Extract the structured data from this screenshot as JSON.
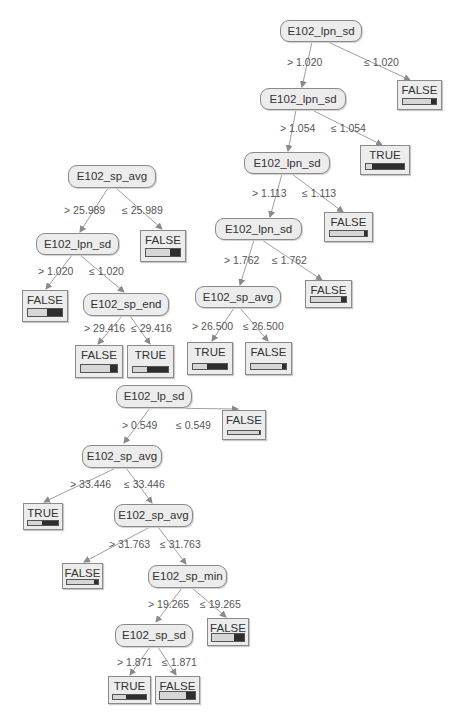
{
  "diagram": {
    "type": "decision-tree",
    "nodes": {
      "a1": {
        "label": "E102_lpn_sd"
      },
      "a2": {
        "label": "E102_lpn_sd"
      },
      "a3": {
        "label": "E102_lpn_sd"
      },
      "a4": {
        "label": "E102_lpn_sd"
      },
      "a5": {
        "label": "E102_sp_avg"
      },
      "b1": {
        "label": "E102_sp_avg"
      },
      "b2": {
        "label": "E102_lpn_sd"
      },
      "b3": {
        "label": "E102_sp_end"
      },
      "c1": {
        "label": "E102_lp_sd"
      },
      "c2": {
        "label": "E102_sp_avg"
      },
      "c3": {
        "label": "E102_sp_avg"
      },
      "c4": {
        "label": "E102_sp_min"
      },
      "c5": {
        "label": "E102_sp_sd"
      }
    },
    "leaves": {
      "la1": {
        "label": "FALSE",
        "dark_fraction": 0.15
      },
      "la2": {
        "label": "TRUE",
        "dark_fraction": 0.85
      },
      "la3": {
        "label": "FALSE",
        "dark_fraction": 0.08
      },
      "la4": {
        "label": "FALSE",
        "dark_fraction": 0.15
      },
      "la5": {
        "label": "TRUE",
        "dark_fraction": 0.6
      },
      "la6": {
        "label": "FALSE",
        "dark_fraction": 0.12
      },
      "lb1": {
        "label": "FALSE",
        "dark_fraction": 0.3
      },
      "lb2": {
        "label": "FALSE",
        "dark_fraction": 0.45
      },
      "lb3": {
        "label": "FALSE",
        "dark_fraction": 0.2
      },
      "lb4": {
        "label": "TRUE",
        "dark_fraction": 0.6
      },
      "lc1": {
        "label": "FALSE",
        "dark_fraction": 0.04
      },
      "lc2": {
        "label": "TRUE",
        "dark_fraction": 0.55
      },
      "lc3": {
        "label": "FALSE",
        "dark_fraction": 0.12
      },
      "lc4": {
        "label": "FALSE",
        "dark_fraction": 0.3
      },
      "lc5": {
        "label": "TRUE",
        "dark_fraction": 0.6
      },
      "lc6": {
        "label": "FALSE",
        "dark_fraction": 0.25
      }
    },
    "edges": {
      "a1_gt": "> 1.020",
      "a1_le": "≤ 1.020",
      "a2_gt": "> 1.054",
      "a2_le": "≤ 1.054",
      "a3_gt": "> 1.113",
      "a3_le": "≤ 1.113",
      "a4_gt": "> 1.762",
      "a4_le": "≤ 1.762",
      "a5_gt": "> 26.500",
      "a5_le": "≤ 26.500",
      "b1_gt": "> 25.989",
      "b1_le": "≤ 25.989",
      "b2_gt": "> 1.020",
      "b2_le": "≤ 1.020",
      "b3_gt": "> 29.416",
      "b3_le": "≤ 29.416",
      "c1_gt": "> 0.549",
      "c1_le": "≤ 0.549",
      "c2_gt": "> 33.446",
      "c2_le": "≤ 33.446",
      "c3_gt": "> 31.763",
      "c3_le": "≤ 31.763",
      "c4_gt": "> 19.265",
      "c4_le": "≤ 19.265",
      "c5_gt": "> 1.871",
      "c5_le": "≤ 1.871"
    },
    "colors": {
      "node_fill": "#ececec",
      "border": "#8a8a8a",
      "edge": "#9a9a9a",
      "bar_light": "#d6d6d6",
      "bar_dark": "#2e2e2e"
    }
  }
}
